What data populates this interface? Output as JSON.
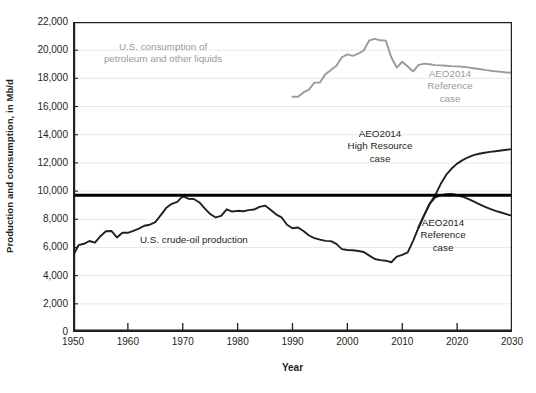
{
  "chart_data": {
    "type": "line",
    "title": "",
    "xlabel": "Year",
    "ylabel": "Production and consumption, in Mb/d",
    "xlim": [
      1950,
      2030
    ],
    "ylim": [
      0,
      22000
    ],
    "xticks": [
      1950,
      1960,
      1970,
      1980,
      1990,
      2000,
      2010,
      2020,
      2030
    ],
    "yticks": [
      0,
      2000,
      4000,
      6000,
      8000,
      10000,
      12000,
      14000,
      16000,
      18000,
      20000,
      22000
    ],
    "ytick_labels": [
      "0",
      "2,000",
      "4,000",
      "6,000",
      "8,000",
      "10,000",
      "12,000",
      "14,000",
      "16,000",
      "18,000",
      "20,000",
      "22,000"
    ],
    "grid": "horizontal",
    "legend_position": "inline-annotations",
    "reference_line": {
      "value": 9700,
      "color": "#000000",
      "width": 3,
      "label": ""
    },
    "series": [
      {
        "name": "U.S. consumption of petroleum and other liquids",
        "color": "#9a9a9a",
        "x": [
          1990,
          1991,
          1992,
          1993,
          1994,
          1995,
          1996,
          1997,
          1998,
          1999,
          2000,
          2001,
          2002,
          2003,
          2004,
          2005,
          2006,
          2007,
          2008,
          2009,
          2010,
          2011,
          2012,
          2013,
          2014,
          2015,
          2016,
          2017,
          2018,
          2019,
          2020,
          2021,
          2022,
          2023,
          2024,
          2025,
          2026,
          2027,
          2028,
          2029,
          2030
        ],
        "values": [
          16700,
          16700,
          17000,
          17200,
          17700,
          17700,
          18300,
          18600,
          18900,
          19500,
          19700,
          19600,
          19750,
          20000,
          20700,
          20800,
          20700,
          20680,
          19500,
          18770,
          19180,
          18840,
          18490,
          18960,
          19050,
          19000,
          18940,
          18920,
          18900,
          18870,
          18850,
          18820,
          18780,
          18720,
          18660,
          18600,
          18550,
          18500,
          18460,
          18420,
          18400
        ]
      },
      {
        "name": "U.S. crude-oil production",
        "color": "#231f20",
        "x": [
          1950,
          1951,
          1952,
          1953,
          1954,
          1955,
          1956,
          1957,
          1958,
          1959,
          1960,
          1961,
          1962,
          1963,
          1964,
          1965,
          1966,
          1967,
          1968,
          1969,
          1970,
          1971,
          1972,
          1973,
          1974,
          1975,
          1976,
          1977,
          1978,
          1979,
          1980,
          1981,
          1982,
          1983,
          1984,
          1985,
          1986,
          1987,
          1988,
          1989,
          1990,
          1991,
          1992,
          1993,
          1994,
          1995,
          1996,
          1997,
          1998,
          1999,
          2000,
          2001,
          2002,
          2003,
          2004,
          2005,
          2006,
          2007,
          2008,
          2009,
          2010,
          2011,
          2012,
          2013
        ],
        "values": [
          5410,
          6160,
          6260,
          6460,
          6340,
          6800,
          7150,
          7170,
          6710,
          7050,
          7040,
          7180,
          7330,
          7540,
          7610,
          7800,
          8300,
          8810,
          9100,
          9240,
          9640,
          9460,
          9440,
          9210,
          8770,
          8370,
          8130,
          8240,
          8710,
          8550,
          8600,
          8570,
          8650,
          8690,
          8880,
          8970,
          8680,
          8350,
          8140,
          7610,
          7360,
          7420,
          7170,
          6850,
          6660,
          6560,
          6470,
          6450,
          6250,
          5880,
          5820,
          5800,
          5750,
          5680,
          5420,
          5180,
          5100,
          5060,
          4950,
          5350,
          5470,
          5650,
          6490,
          7450
        ]
      },
      {
        "name": "AEO2014 High Resource case",
        "color": "#231f20",
        "x": [
          2013,
          2014,
          2015,
          2016,
          2017,
          2018,
          2019,
          2020,
          2021,
          2022,
          2023,
          2024,
          2025,
          2026,
          2027,
          2028,
          2029,
          2030
        ],
        "values": [
          7450,
          8300,
          9100,
          9700,
          10500,
          11150,
          11600,
          11950,
          12200,
          12400,
          12550,
          12650,
          12720,
          12780,
          12830,
          12880,
          12930,
          12980
        ]
      },
      {
        "name": "AEO2014 Reference case",
        "color": "#231f20",
        "x": [
          2013,
          2014,
          2015,
          2016,
          2017,
          2018,
          2019,
          2020,
          2021,
          2022,
          2023,
          2024,
          2025,
          2026,
          2027,
          2028,
          2029,
          2030
        ],
        "values": [
          7450,
          8300,
          9100,
          9550,
          9700,
          9780,
          9800,
          9720,
          9600,
          9450,
          9270,
          9080,
          8900,
          8740,
          8600,
          8480,
          8360,
          8250
        ]
      }
    ],
    "annotations": [
      {
        "name": "consumption-label",
        "text": "U.S. consumption of\npetroleum and other liquids",
        "color": "#9a9a9a",
        "x_px": 163,
        "y_px": 50,
        "align": "center"
      },
      {
        "name": "aeo-reference-gray-label",
        "text": "AEO2014\nReference\ncase",
        "color": "#9a9a9a",
        "x_px": 450,
        "y_px": 77,
        "align": "center"
      },
      {
        "name": "aeo-high-resource-label",
        "text": "AEO2014\nHigh Resource\ncase",
        "color": "#231f20",
        "x_px": 380,
        "y_px": 137,
        "align": "center"
      },
      {
        "name": "crude-oil-production-label",
        "text": "U.S. crude-oil production",
        "color": "#231f20",
        "x_px": 140,
        "y_px": 243,
        "align": "left"
      },
      {
        "name": "aeo-reference-black-label",
        "text": "AEO2014\nReference\ncase",
        "color": "#231f20",
        "x_px": 443,
        "y_px": 226,
        "align": "center"
      }
    ]
  },
  "axis": {
    "ylabel": "Production and consumption, in Mb/d",
    "xlabel": "Year"
  },
  "colors": {
    "axis": "#231f20",
    "grid": "#e8e8e8",
    "consumption": "#9a9a9a",
    "production": "#231f20",
    "background": "#ffffff"
  }
}
